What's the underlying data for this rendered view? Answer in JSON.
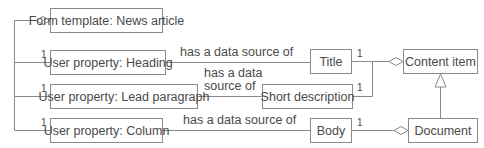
{
  "diagram": {
    "type": "uml-class-diagram",
    "colors": {
      "line": "#8a8a8a",
      "text": "#4a4a4a",
      "background": "#ffffff"
    },
    "nodes": {
      "form_template": "Form template: News article",
      "heading": "User property: Heading",
      "lead_paragraph": "User property: Lead paragraph",
      "column": "User property: Column",
      "title": "Title",
      "short_description": "Short description",
      "body": "Body",
      "content_item": "Content item",
      "document": "Document"
    },
    "edge_labels": {
      "heading_title": "has a data source of",
      "lead_short_line1": "has a data",
      "lead_short_line2": "source of",
      "column_body": "has a data source of"
    },
    "multiplicities": {
      "heading": "1",
      "lead_paragraph": "1",
      "column": "1",
      "title": "1",
      "short_description": "1",
      "body": "1"
    },
    "relationships": [
      {
        "from": "Form template: News article",
        "to": [
          "User property: Heading",
          "User property: Lead paragraph",
          "User property: Column"
        ],
        "kind": "aggregation"
      },
      {
        "from": "User property: Heading",
        "to": "Title",
        "kind": "association",
        "label": "has a data source of"
      },
      {
        "from": "User property: Lead paragraph",
        "to": "Short description",
        "kind": "association",
        "label": "has a data source of"
      },
      {
        "from": "User property: Column",
        "to": "Body",
        "kind": "association",
        "label": "has a data source of"
      },
      {
        "from": "Content item",
        "to": [
          "Title",
          "Short description"
        ],
        "kind": "aggregation"
      },
      {
        "from": "Document",
        "to": "Body",
        "kind": "aggregation"
      },
      {
        "from": "Document",
        "to": "Content item",
        "kind": "generalization"
      }
    ]
  }
}
